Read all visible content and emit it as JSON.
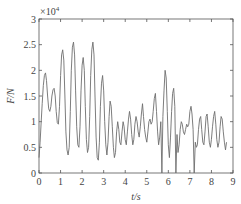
{
  "chart_data": {
    "type": "line",
    "title": "",
    "xlabel": "t/s",
    "ylabel": "F/N",
    "y_exponent_label": "×10",
    "y_exponent_power": "4",
    "xlim": [
      0,
      9
    ],
    "ylim": [
      0,
      30000
    ],
    "x_ticks": [
      "0",
      "1",
      "2",
      "3",
      "4",
      "5",
      "6",
      "7",
      "8",
      "9"
    ],
    "y_ticks": [
      "0",
      "0.5",
      "1",
      "1.5",
      "2",
      "2.5",
      "3"
    ],
    "grid": false,
    "legend": null,
    "line_color": "#6e6e6e",
    "series": [
      {
        "name": "F",
        "x": [
          0,
          0.05,
          0.1,
          0.15,
          0.2,
          0.25,
          0.3,
          0.35,
          0.4,
          0.45,
          0.5,
          0.55,
          0.6,
          0.65,
          0.7,
          0.75,
          0.8,
          0.85,
          0.9,
          0.95,
          1.0,
          1.05,
          1.1,
          1.15,
          1.2,
          1.25,
          1.3,
          1.35,
          1.4,
          1.45,
          1.5,
          1.55,
          1.6,
          1.65,
          1.7,
          1.75,
          1.8,
          1.85,
          1.9,
          1.95,
          2.0,
          2.05,
          2.1,
          2.15,
          2.2,
          2.25,
          2.3,
          2.35,
          2.4,
          2.45,
          2.5,
          2.55,
          2.6,
          2.65,
          2.7,
          2.75,
          2.8,
          2.85,
          2.9,
          2.95,
          3.0,
          3.05,
          3.1,
          3.15,
          3.2,
          3.25,
          3.3,
          3.35,
          3.4,
          3.45,
          3.5,
          3.55,
          3.6,
          3.65,
          3.7,
          3.75,
          3.8,
          3.85,
          3.9,
          3.95,
          4.0,
          4.05,
          4.1,
          4.15,
          4.2,
          4.25,
          4.3,
          4.35,
          4.4,
          4.45,
          4.5,
          4.55,
          4.6,
          4.65,
          4.7,
          4.75,
          4.8,
          4.85,
          4.9,
          4.95,
          5.0,
          5.05,
          5.1,
          5.15,
          5.2,
          5.25,
          5.3,
          5.35,
          5.4,
          5.45,
          5.5,
          5.55,
          5.6,
          5.65,
          5.7,
          5.75,
          5.8,
          5.85,
          5.9,
          5.95,
          6.0,
          6.05,
          6.1,
          6.15,
          6.2,
          6.25,
          6.3,
          6.35,
          6.4,
          6.45,
          6.5,
          6.55,
          6.6,
          6.65,
          6.7,
          6.75,
          6.8,
          6.85,
          6.9,
          6.95,
          7.0,
          7.05,
          7.1,
          7.15,
          7.2,
          7.25,
          7.3,
          7.35,
          7.4,
          7.45,
          7.5,
          7.55,
          7.6,
          7.65,
          7.7,
          7.75,
          7.8,
          7.85,
          7.9,
          7.95,
          8.0,
          8.05,
          8.1,
          8.15,
          8.2,
          8.25,
          8.3,
          8.35,
          8.4,
          8.45,
          8.5,
          8.55,
          8.6,
          8.65,
          8.7,
          8.75,
          8.8,
          8.85,
          8.9,
          8.95,
          9.0
        ],
        "values_e4": [
          0.3,
          0.6,
          1.0,
          1.35,
          1.7,
          1.9,
          1.95,
          1.8,
          1.5,
          1.25,
          1.2,
          1.3,
          1.5,
          1.62,
          1.65,
          1.5,
          1.2,
          0.98,
          0.95,
          1.3,
          1.9,
          2.3,
          2.4,
          2.2,
          1.5,
          0.8,
          0.45,
          0.35,
          0.5,
          1.2,
          2.0,
          2.45,
          2.55,
          2.3,
          1.6,
          0.9,
          0.55,
          0.5,
          0.9,
          1.6,
          2.1,
          2.25,
          2.0,
          1.3,
          0.65,
          0.4,
          0.5,
          1.1,
          1.9,
          2.4,
          2.55,
          2.3,
          1.5,
          0.7,
          0.3,
          0.25,
          0.6,
          1.3,
          1.75,
          1.9,
          1.6,
          1.0,
          0.55,
          0.35,
          0.6,
          1.1,
          1.4,
          1.3,
          0.9,
          0.5,
          0.3,
          0.4,
          0.8,
          1.0,
          0.85,
          0.6,
          0.55,
          0.8,
          1.0,
          0.9,
          0.65,
          0.55,
          0.8,
          1.05,
          1.2,
          1.05,
          0.75,
          0.55,
          0.65,
          0.95,
          1.1,
          1.0,
          0.8,
          0.7,
          0.9,
          1.15,
          1.35,
          1.1,
          0.85,
          0.7,
          0.6,
          0.8,
          1.0,
          1.05,
          0.95,
          1.0,
          1.2,
          1.45,
          1.55,
          1.2,
          0.8,
          0.55,
          0.7,
          1.0,
          0.0,
          1.1,
          1.6,
          2.0,
          1.85,
          1.2,
          0.55,
          0.3,
          0.7,
          1.2,
          1.55,
          1.65,
          1.3,
          0.0,
          0.75,
          0.4,
          0.55,
          0.85,
          1.0,
          0.95,
          0.8,
          0.75,
          0.85,
          0.95,
          0.9,
          0.95,
          1.2,
          1.3,
          1.15,
          0.85,
          0.0,
          0.6,
          0.5,
          0.55,
          0.85,
          1.05,
          1.1,
          0.85,
          0.6,
          0.55,
          0.8,
          1.1,
          1.15,
          0.9,
          0.6,
          0.5,
          0.65,
          0.9,
          1.1,
          1.2,
          0.95,
          0.65,
          0.5,
          0.6,
          0.9,
          1.1,
          1.05,
          0.8,
          0.6,
          0.45,
          0.6
        ]
      }
    ]
  }
}
